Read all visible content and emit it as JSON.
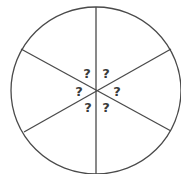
{
  "diagram": {
    "type": "circle-divided-into-sectors",
    "sector_count": 6,
    "stroke_color": "#4a4a4a",
    "background": "#ffffff",
    "labels": [
      {
        "position": "upper-left",
        "text": "?"
      },
      {
        "position": "upper-right",
        "text": "?"
      },
      {
        "position": "right",
        "text": "?"
      },
      {
        "position": "lower-right",
        "text": "?"
      },
      {
        "position": "lower-left",
        "text": "?"
      },
      {
        "position": "left",
        "text": "?"
      }
    ]
  }
}
